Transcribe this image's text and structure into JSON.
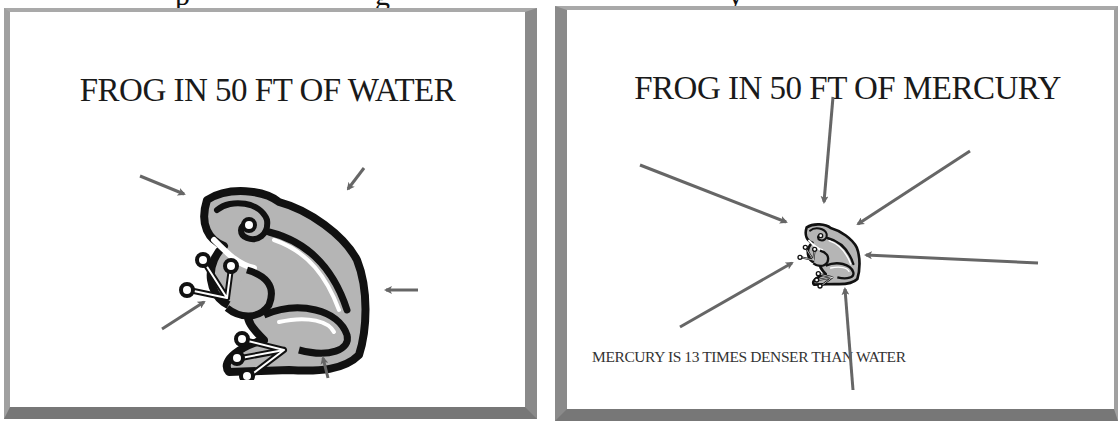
{
  "cut_off_text": {
    "fragments": [
      {
        "text": "p",
        "x": 175
      },
      {
        "text": "g",
        "x": 375
      },
      {
        "text": "y",
        "x": 728
      }
    ]
  },
  "slides": [
    {
      "title": "FROG IN 50 FT OF WATER",
      "frog": {
        "scale": "large"
      },
      "arrow_count": 5
    },
    {
      "title": "FROG IN 50 FT OF MERCURY",
      "frog": {
        "scale": "small"
      },
      "arrow_count": 6,
      "caption": "MERCURY IS 13 TIMES DENSER THAN WATER"
    }
  ],
  "colors": {
    "arrow": "#666666",
    "frog_outline": "#111111",
    "frog_fill": "#b5b5b5",
    "border": "#8a8a8a"
  }
}
